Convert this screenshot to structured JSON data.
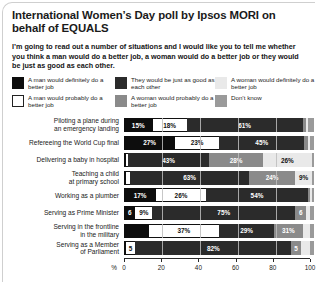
{
  "title": "International Women’s Day poll by Ipsos MORI on behalf of EQUALS",
  "intro": "I’m going to read out a number of situations and I would like you to tell me whether you think a man would do a better job, a woman would do a better job or they would be just as good as each other.",
  "legend": [
    {
      "label": "A man would definitely do a better job",
      "key": "man_definitely",
      "color": "#0d0d0d",
      "swatch": "solid-black"
    },
    {
      "label": "They would be just as good as each other",
      "key": "same",
      "color": "#2b2b2b",
      "swatch": "solid-dark-gray"
    },
    {
      "label": "A woman would definitely do a better job",
      "key": "woman_definitely",
      "color": "#e9e9e9",
      "swatch": "solid-light-gray"
    },
    {
      "label": "A man would probably do a better job",
      "key": "man_probably",
      "color": "#ffffff",
      "swatch": "outlined-white"
    },
    {
      "label": "A woman would probably do a better job",
      "key": "woman_probably",
      "color": "#8a8a8a",
      "swatch": "solid-mid-gray"
    },
    {
      "label": "Don’t know",
      "key": "dont_know",
      "color": "#9a9a9a",
      "swatch": "solid-gray"
    }
  ],
  "chart_data": {
    "type": "bar",
    "orientation": "horizontal",
    "stacked": true,
    "stack_total": 100,
    "title": "International Women’s Day poll by Ipsos MORI on behalf of EQUALS",
    "xlabel": "%",
    "ylabel": "",
    "xlim": [
      0,
      100
    ],
    "xticks": [
      0,
      20,
      40,
      60,
      80,
      100
    ],
    "xtick_labels": [
      "0",
      "20",
      "40",
      "60",
      "80",
      "100"
    ],
    "grid": true,
    "legend_position": "top",
    "categories": [
      "Piloting a plane during an emergency landing",
      "Refereeing the World Cup final",
      "Delivering a baby in hospital",
      "Teaching a child at primary school",
      "Working as a plumber",
      "Serving as Prime Minister",
      "Serving in the frontline in the military",
      "Serving as a Member of Parliament"
    ],
    "series": [
      {
        "name": "A man would definitely do a better job",
        "key": "man_definitely",
        "color": "#0d0d0d",
        "values": [
          15,
          27,
          1,
          1,
          17,
          6,
          13,
          1
        ]
      },
      {
        "name": "A man would probably do a better job",
        "key": "man_probably",
        "color": "#ffffff",
        "values": [
          18,
          23,
          1,
          2,
          26,
          9,
          37,
          5
        ]
      },
      {
        "name": "They would be just as good as each other",
        "key": "same",
        "color": "#2b2b2b",
        "values": [
          61,
          45,
          43,
          63,
          54,
          75,
          29,
          82
        ]
      },
      {
        "name": "A woman would probably do a better job",
        "key": "woman_probably",
        "color": "#8a8a8a",
        "values": [
          2,
          2,
          28,
          24,
          1,
          6,
          15,
          5
        ]
      },
      {
        "name": "A woman would definitely do a better job",
        "key": "woman_definitely",
        "color": "#e9e9e9",
        "values": [
          1,
          1,
          26,
          9,
          1,
          2,
          4,
          5
        ]
      },
      {
        "name": "Don’t know",
        "key": "dont_know",
        "color": "#9a9a9a",
        "values": [
          3,
          2,
          1,
          1,
          1,
          2,
          2,
          2
        ]
      }
    ],
    "rows": [
      {
        "label_line1": "Piloting a plane during",
        "label_line2": "an emergency landing",
        "segments": [
          {
            "key": "man_definitely",
            "value": 15,
            "text": "15%"
          },
          {
            "key": "man_probably",
            "value": 18,
            "text": "18%"
          },
          {
            "key": "same",
            "value": 61,
            "text": "61%"
          },
          {
            "key": "woman_probably",
            "value": 2,
            "text": ""
          },
          {
            "key": "woman_definitely",
            "value": 1,
            "text": ""
          },
          {
            "key": "dont_know",
            "value": 3,
            "text": ""
          }
        ]
      },
      {
        "label_line1": "Refereeing the World Cup final",
        "label_line2": "",
        "segments": [
          {
            "key": "man_definitely",
            "value": 27,
            "text": "27%"
          },
          {
            "key": "man_probably",
            "value": 23,
            "text": "23%"
          },
          {
            "key": "same",
            "value": 45,
            "text": "45%"
          },
          {
            "key": "woman_probably",
            "value": 2,
            "text": ""
          },
          {
            "key": "woman_definitely",
            "value": 1,
            "text": ""
          },
          {
            "key": "dont_know",
            "value": 2,
            "text": ""
          }
        ]
      },
      {
        "label_line1": "Delivering a baby in hospital",
        "label_line2": "",
        "segments": [
          {
            "key": "man_definitely",
            "value": 1,
            "text": ""
          },
          {
            "key": "man_probably",
            "value": 1,
            "text": ""
          },
          {
            "key": "same",
            "value": 43,
            "text": "43%"
          },
          {
            "key": "woman_probably",
            "value": 28,
            "text": "28%"
          },
          {
            "key": "woman_definitely",
            "value": 26,
            "text": "26%"
          },
          {
            "key": "dont_know",
            "value": 1,
            "text": ""
          }
        ]
      },
      {
        "label_line1": "Teaching a child",
        "label_line2": "at primary school",
        "segments": [
          {
            "key": "man_definitely",
            "value": 1,
            "text": ""
          },
          {
            "key": "man_probably",
            "value": 2,
            "text": ""
          },
          {
            "key": "same",
            "value": 63,
            "text": "63%"
          },
          {
            "key": "woman_probably",
            "value": 24,
            "text": "24%"
          },
          {
            "key": "woman_definitely",
            "value": 9,
            "text": "9%"
          },
          {
            "key": "dont_know",
            "value": 1,
            "text": ""
          }
        ]
      },
      {
        "label_line1": "Working as a plumber",
        "label_line2": "",
        "segments": [
          {
            "key": "man_definitely",
            "value": 17,
            "text": "17%"
          },
          {
            "key": "man_probably",
            "value": 26,
            "text": "26%"
          },
          {
            "key": "same",
            "value": 54,
            "text": "54%"
          },
          {
            "key": "woman_probably",
            "value": 1,
            "text": ""
          },
          {
            "key": "woman_definitely",
            "value": 1,
            "text": ""
          },
          {
            "key": "dont_know",
            "value": 1,
            "text": ""
          }
        ]
      },
      {
        "label_line1": "Serving as Prime Minister",
        "label_line2": "",
        "segments": [
          {
            "key": "man_definitely",
            "value": 6,
            "text": "6"
          },
          {
            "key": "man_probably",
            "value": 9,
            "text": "9%"
          },
          {
            "key": "same",
            "value": 75,
            "text": "75%"
          },
          {
            "key": "woman_probably",
            "value": 6,
            "text": "6"
          },
          {
            "key": "woman_definitely",
            "value": 2,
            "text": ""
          },
          {
            "key": "dont_know",
            "value": 2,
            "text": ""
          }
        ]
      },
      {
        "label_line1": "Serving in the frontline",
        "label_line2": "in the military",
        "segments": [
          {
            "key": "man_definitely",
            "value": 13,
            "text": ""
          },
          {
            "key": "man_probably",
            "value": 37,
            "text": "37%"
          },
          {
            "key": "same",
            "value": 29,
            "text": "29%"
          },
          {
            "key": "woman_probably",
            "value": 15,
            "text": "31%"
          },
          {
            "key": "woman_definitely",
            "value": 4,
            "text": ""
          },
          {
            "key": "dont_know",
            "value": 2,
            "text": ""
          }
        ]
      },
      {
        "label_line1": "Serving as a Member",
        "label_line2": "of Parliament",
        "segments": [
          {
            "key": "man_definitely",
            "value": 1,
            "text": ""
          },
          {
            "key": "man_probably",
            "value": 5,
            "text": "5"
          },
          {
            "key": "same",
            "value": 82,
            "text": "82%"
          },
          {
            "key": "woman_probably",
            "value": 5,
            "text": "5"
          },
          {
            "key": "woman_definitely",
            "value": 5,
            "text": ""
          },
          {
            "key": "dont_know",
            "value": 2,
            "text": ""
          }
        ]
      }
    ]
  }
}
